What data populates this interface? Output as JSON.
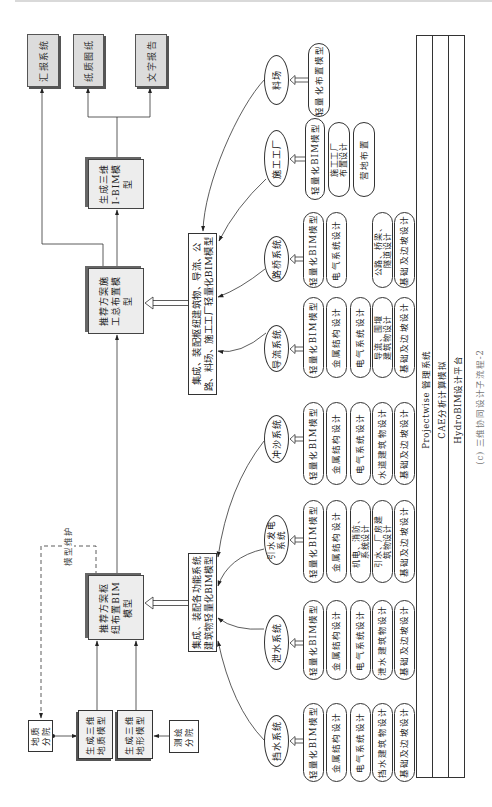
{
  "figure": {
    "caption": "(c) 三维协同设计子流程-2",
    "outputs": [
      {
        "label": "汇报系统"
      },
      {
        "label": "纸质图纸"
      },
      {
        "label": "文字报告"
      }
    ],
    "process": {
      "ibim_model": "生成三维\nI-BIM模\n型",
      "construction_layout": "推荐方案施\n工总布置模\n型",
      "hub_layout": "推荐方案枢\n纽布置BIM\n模型"
    },
    "integration": {
      "hub": "集成、装配各功能系统\n建筑物轻量化BIM模型",
      "construction": "集成、装配枢纽建筑物、导流、公\n路、料场、施工工厂轻量化BIM模型"
    },
    "sources": {
      "geology_institute": "地质\n分院",
      "geology_model": "生成三维\n地质模型",
      "terrain_model": "生成三维\n地形模型",
      "survey_institute": "测绘\n分院"
    },
    "maintenance_label": "模型维护",
    "systems": [
      {
        "name": "挡水系统",
        "items": [
          "轻量化BIM模型",
          "金属结构设计",
          "电气系统设计",
          "挡水建筑物设计",
          "基础及边坡设计"
        ]
      },
      {
        "name": "泄水系统",
        "items": [
          "轻量化BIM模型",
          "金属结构设计",
          "电气系统设计",
          "泄水建筑物设计",
          "基础及边坡设计"
        ]
      },
      {
        "name": "引水发电\n系统",
        "items": [
          "轻量化BIM模型",
          "金属结构设计",
          "机电、消防、\n系统设计",
          "引水、厂房建\n筑物设计",
          "基础及边坡设计"
        ]
      },
      {
        "name": "冲沙系统",
        "items": [
          "轻量化BIM模型",
          "金属结构设计",
          "电气系统设计",
          "水道建筑物设计",
          "基础及边坡设计"
        ]
      },
      {
        "name": "导流系统",
        "items": [
          "轻量化BIM模型",
          "金属结构设计",
          "电气系统设计",
          "导流、围堰\n建筑物设计",
          "基础及边坡设计"
        ]
      },
      {
        "name": "路桥系统",
        "items": [
          "轻量化BIM模型",
          "电气系统设计",
          "公路、桥梁、\n隧道设计",
          "基础及边坡设计"
        ]
      },
      {
        "name": "施工工厂",
        "items": [
          "轻量化BIM模型",
          "施工工厂\n布置设计",
          "营地布置"
        ]
      },
      {
        "name": "料场",
        "items": [
          "轻量化布置模型"
        ]
      }
    ],
    "platform_layers": [
      "Projectwise 管理系统",
      "CAE分析计算模拟",
      "HydroBIM设计平台"
    ]
  }
}
